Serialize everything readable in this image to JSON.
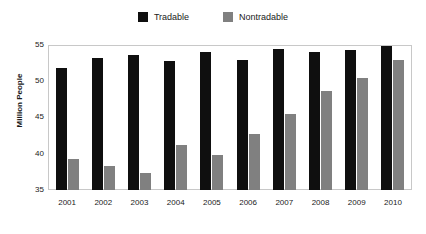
{
  "chart_data": {
    "type": "bar",
    "title": "",
    "subtitle": "",
    "xlabel": "",
    "ylabel": "Million People",
    "ylim": [
      35,
      55
    ],
    "yticks": [
      35,
      40,
      45,
      50,
      55
    ],
    "grid": false,
    "legend_position": "top-center",
    "categories": [
      "2001",
      "2002",
      "2003",
      "2004",
      "2005",
      "2006",
      "2007",
      "2008",
      "2009",
      "2010"
    ],
    "series": [
      {
        "name": "Tradable",
        "color": "#0f0f0f",
        "values": [
          51.9,
          53.4,
          53.8,
          52.9,
          54.2,
          53.1,
          54.6,
          54.1,
          54.5,
          55.0
        ]
      },
      {
        "name": "Nontradable",
        "color": "#808080",
        "values": [
          39.3,
          38.4,
          37.3,
          41.2,
          39.8,
          42.8,
          45.6,
          48.7,
          50.5,
          53.1
        ]
      }
    ]
  },
  "legend": {
    "items": [
      {
        "label": "Tradable",
        "swatch_icon": "filled-square-icon",
        "color": "#0f0f0f"
      },
      {
        "label": "Nontradable",
        "swatch_icon": "filled-square-icon",
        "color": "#808080"
      }
    ]
  },
  "axes": {
    "y_title": "Million People",
    "y_tick_labels": [
      "55",
      "50",
      "45",
      "40",
      "35"
    ],
    "x_tick_labels": [
      "2001",
      "2002",
      "2003",
      "2004",
      "2005",
      "2006",
      "2007",
      "2008",
      "2009",
      "2010"
    ]
  },
  "colors": {
    "tradable": "#0f0f0f",
    "nontradable": "#808080",
    "frame": "#c8c8c8",
    "background": "#ffffff",
    "text": "#1a1a1a"
  }
}
